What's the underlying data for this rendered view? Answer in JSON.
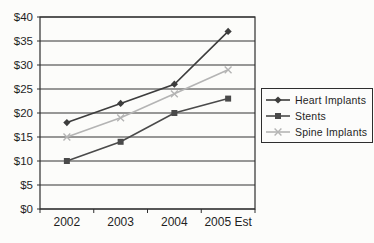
{
  "chart_data": {
    "type": "line",
    "title": "",
    "categories": [
      "2002",
      "2003",
      "2004",
      "2005 Est"
    ],
    "series": [
      {
        "name": "Heart Implants",
        "values": [
          18,
          22,
          26,
          37
        ],
        "color": "#3d3d3d",
        "marker": "diamond",
        "line_style": "solid"
      },
      {
        "name": "Stents",
        "values": [
          10,
          14,
          20,
          23
        ],
        "color": "#4a4a4a",
        "marker": "square",
        "line_style": "solid"
      },
      {
        "name": "Spine Implants",
        "values": [
          15,
          19,
          24,
          29
        ],
        "color": "#b4b4b4",
        "marker": "x",
        "line_style": "solid"
      }
    ],
    "y_axis": {
      "min": 0,
      "max": 40,
      "step": 5,
      "tick_labels": [
        "$0",
        "$5",
        "$10",
        "$15",
        "$20",
        "$25",
        "$30",
        "$35",
        "$40"
      ]
    },
    "x_axis": {
      "tick_labels": [
        "2002",
        "2003",
        "2004",
        "2005 Est"
      ]
    },
    "grid": "horizontal",
    "legend_position": "right",
    "colors": {
      "axis": "#2e2e2e",
      "gridline": "#333333",
      "text": "#1f1f1f",
      "plot_background": "#fcfcfa",
      "legend_background": "#fcfcfb"
    }
  }
}
